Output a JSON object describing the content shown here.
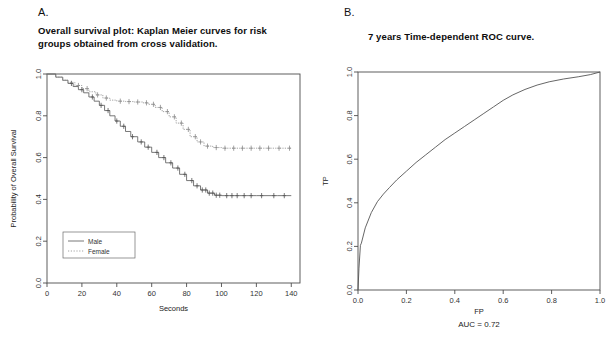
{
  "figure": {
    "panels": [
      {
        "letter": "A.",
        "title": "Overall survival plot: Kaplan Meier curves for risk groups obtained from cross validation."
      },
      {
        "letter": "B.",
        "title": "7 years Time-dependent ROC curve."
      }
    ]
  },
  "chart_data": [
    {
      "type": "line",
      "title": "Overall survival plot: Kaplan Meier curves for risk groups obtained from cross validation.",
      "subtitle": "Kaplan Meier survival curves with censoring marks",
      "xlabel": "Seconds",
      "ylabel": "Probability of Overall Survival",
      "xlim": [
        0,
        145
      ],
      "ylim": [
        0.0,
        1.0
      ],
      "xticks": [
        0,
        20,
        40,
        60,
        80,
        100,
        120,
        140
      ],
      "xticklabels": [
        "0",
        "20",
        "40",
        "60",
        "80",
        "100",
        "120",
        "140"
      ],
      "yticks": [
        0.0,
        0.2,
        0.4,
        0.6,
        0.8,
        1.0
      ],
      "yticklabels": [
        "0.0",
        "0.2",
        "0.4",
        "0.6",
        "0.8",
        "1.0"
      ],
      "grid": false,
      "legend_position": "bottom-left",
      "legend": [
        "Male",
        "Female"
      ],
      "series": [
        {
          "name": "Male",
          "linestyle": "solid",
          "color": "#555555",
          "x": [
            0,
            5,
            9,
            12,
            15,
            18,
            21,
            24,
            27,
            30,
            33,
            36,
            39,
            42,
            45,
            48,
            52,
            56,
            60,
            64,
            68,
            72,
            76,
            80,
            84,
            88,
            92,
            96,
            100,
            110,
            120,
            132,
            140
          ],
          "y": [
            1.0,
            0.985,
            0.97,
            0.955,
            0.94,
            0.925,
            0.91,
            0.89,
            0.87,
            0.85,
            0.825,
            0.8,
            0.775,
            0.75,
            0.725,
            0.7,
            0.675,
            0.65,
            0.625,
            0.6,
            0.575,
            0.55,
            0.52,
            0.49,
            0.465,
            0.445,
            0.43,
            0.42,
            0.418,
            0.418,
            0.418,
            0.418,
            0.418
          ],
          "censor_x": [
            14,
            20,
            26,
            31,
            35,
            40,
            44,
            49,
            54,
            58,
            63,
            67,
            71,
            75,
            79,
            83,
            86,
            89,
            91,
            93,
            95,
            97,
            99,
            103,
            106,
            109,
            113,
            117,
            123,
            130,
            136
          ],
          "plateau_value": 0.42
        },
        {
          "name": "Female",
          "linestyle": "dotted",
          "color": "#8a8a8a",
          "x": [
            0,
            5,
            9,
            12,
            16,
            20,
            24,
            28,
            32,
            36,
            40,
            45,
            50,
            55,
            58,
            62,
            66,
            70,
            74,
            78,
            82,
            86,
            90,
            95,
            100,
            110,
            120,
            130,
            140
          ],
          "y": [
            1.0,
            0.985,
            0.97,
            0.96,
            0.945,
            0.93,
            0.915,
            0.9,
            0.885,
            0.875,
            0.87,
            0.868,
            0.866,
            0.862,
            0.855,
            0.84,
            0.82,
            0.795,
            0.765,
            0.735,
            0.7,
            0.675,
            0.655,
            0.648,
            0.645,
            0.645,
            0.645,
            0.645,
            0.645
          ],
          "censor_x": [
            18,
            23,
            29,
            34,
            42,
            47,
            52,
            57,
            61,
            65,
            69,
            73,
            77,
            81,
            85,
            88,
            92,
            97,
            102,
            107,
            112,
            117,
            122,
            127,
            133,
            139
          ],
          "plateau_value": 0.645
        }
      ]
    },
    {
      "type": "line",
      "title": "7 years Time-dependent ROC curve.",
      "xlabel": "FP",
      "ylabel": "TP",
      "xlim": [
        0.0,
        1.0
      ],
      "ylim": [
        0.0,
        1.0
      ],
      "xticks": [
        0.0,
        0.2,
        0.4,
        0.6,
        0.8,
        1.0
      ],
      "xticklabels": [
        "0.0",
        "0.2",
        "0.4",
        "0.6",
        "0.8",
        "1.0"
      ],
      "yticks": [
        0.0,
        0.2,
        0.4,
        0.6,
        0.8,
        1.0
      ],
      "yticklabels": [
        "0.0",
        "0.2",
        "0.4",
        "0.6",
        "0.8",
        "1.0"
      ],
      "grid": false,
      "annotation": "AUC = 0.72",
      "auc": 0.72,
      "series": [
        {
          "name": "ROC",
          "linestyle": "solid",
          "color": "#555555",
          "x": [
            0.0,
            0.004,
            0.01,
            0.014,
            0.03,
            0.055,
            0.08,
            0.105,
            0.13,
            0.16,
            0.2,
            0.24,
            0.28,
            0.32,
            0.36,
            0.4,
            0.44,
            0.48,
            0.52,
            0.56,
            0.6,
            0.64,
            0.69,
            0.74,
            0.79,
            0.85,
            0.91,
            0.96,
            1.0
          ],
          "y": [
            0.0,
            0.1,
            0.205,
            0.215,
            0.285,
            0.355,
            0.405,
            0.44,
            0.47,
            0.505,
            0.545,
            0.585,
            0.62,
            0.655,
            0.69,
            0.72,
            0.75,
            0.78,
            0.81,
            0.84,
            0.87,
            0.895,
            0.92,
            0.94,
            0.955,
            0.968,
            0.978,
            0.988,
            1.0
          ]
        }
      ]
    }
  ]
}
